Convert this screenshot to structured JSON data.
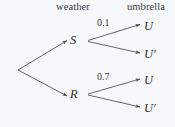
{
  "diagram": {
    "type": "probability-tree",
    "headers": {
      "weather": "weather",
      "umbrella": "umbrella"
    },
    "nodes": {
      "root": {
        "label": "",
        "x": 18,
        "y": 70
      },
      "s": {
        "label": "S",
        "x": 74,
        "y": 41
      },
      "r": {
        "label": "R",
        "x": 74,
        "y": 95
      }
    },
    "leaves": [
      {
        "label": "U",
        "x": 148,
        "y": 27
      },
      {
        "label": "U′",
        "x": 148,
        "y": 55
      },
      {
        "label": "U",
        "x": 148,
        "y": 81
      },
      {
        "label": "U′",
        "x": 148,
        "y": 110
      }
    ],
    "edge_labels": {
      "s_to_u": "0.1",
      "r_to_u": "0.7"
    },
    "colors": {
      "background": "#f7f8f9",
      "line": "#4a4a4c",
      "text": "#2e2e30"
    }
  }
}
